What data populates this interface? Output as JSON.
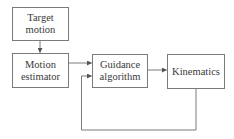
{
  "diagram": {
    "type": "block-diagram",
    "nodes": [
      {
        "id": "target_motion",
        "label_line1": "Target",
        "label_line2": "motion"
      },
      {
        "id": "motion_estimator",
        "label_line1": "Motion",
        "label_line2": "estimator"
      },
      {
        "id": "guidance_algorithm",
        "label_line1": "Guidance",
        "label_line2": "algorithm"
      },
      {
        "id": "kinematics",
        "label_line1": "Kinematics",
        "label_line2": ""
      }
    ],
    "edges": [
      {
        "from": "target_motion",
        "to": "motion_estimator"
      },
      {
        "from": "motion_estimator",
        "to": "guidance_algorithm"
      },
      {
        "from": "guidance_algorithm",
        "to": "kinematics"
      },
      {
        "from": "kinematics",
        "to": "guidance_algorithm",
        "kind": "feedback"
      }
    ],
    "colors": {
      "line": "#7a7a7a",
      "text": "#3a3a3a",
      "background": "#ffffff"
    }
  }
}
